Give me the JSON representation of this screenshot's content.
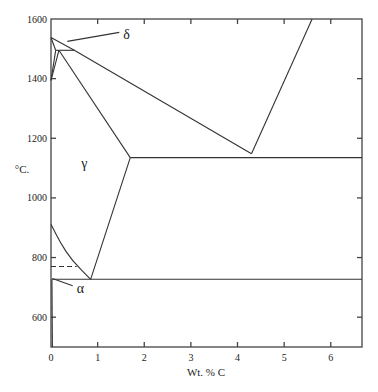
{
  "chart_data": {
    "type": "line",
    "title": "",
    "xlabel": "Wt. % C",
    "ylabel": "°C.",
    "xlim": [
      0,
      6.67
    ],
    "ylim": [
      500,
      1600
    ],
    "grid": false,
    "x_ticks": [
      0,
      1,
      2,
      3,
      4,
      5,
      6
    ],
    "x_tick_labels": [
      "0",
      "1",
      "2",
      "3",
      "4",
      "5",
      "6"
    ],
    "y_ticks": [
      600,
      800,
      1000,
      1200,
      1400,
      1600
    ],
    "y_tick_labels": [
      "600",
      "800",
      "1000",
      "1200",
      "1400",
      "1600"
    ],
    "series": [
      {
        "name": "liquidus-hypoeutectic",
        "style": "solid",
        "points": [
          [
            0,
            1538
          ],
          [
            0.5,
            1495
          ],
          [
            4.3,
            1148
          ]
        ]
      },
      {
        "name": "liquidus-hypereutectic",
        "style": "solid",
        "points": [
          [
            4.3,
            1148
          ],
          [
            5.6,
            1600
          ]
        ]
      },
      {
        "name": "delta-solidus",
        "style": "solid",
        "points": [
          [
            0,
            1538
          ],
          [
            0.1,
            1495
          ]
        ]
      },
      {
        "name": "peritectic-line",
        "style": "solid",
        "points": [
          [
            0.1,
            1495
          ],
          [
            0.5,
            1495
          ]
        ]
      },
      {
        "name": "delta-gamma-upper",
        "style": "solid",
        "points": [
          [
            0,
            1394
          ],
          [
            0.1,
            1495
          ]
        ]
      },
      {
        "name": "delta-gamma-lower",
        "style": "solid",
        "points": [
          [
            0,
            1394
          ],
          [
            0.17,
            1495
          ]
        ]
      },
      {
        "name": "austenite-solidus",
        "style": "solid",
        "points": [
          [
            0.17,
            1495
          ],
          [
            1.7,
            1135
          ]
        ]
      },
      {
        "name": "eutectic-line",
        "style": "solid",
        "points": [
          [
            1.7,
            1135
          ],
          [
            6.67,
            1135
          ]
        ]
      },
      {
        "name": "acm-line",
        "style": "solid",
        "points": [
          [
            1.7,
            1135
          ],
          [
            0.85,
            727
          ]
        ]
      },
      {
        "name": "a3-line",
        "style": "curve",
        "points": [
          [
            0,
            912
          ],
          [
            0.2,
            850
          ],
          [
            0.45,
            790
          ],
          [
            0.85,
            727
          ]
        ]
      },
      {
        "name": "eutectoid-line",
        "style": "solid",
        "points": [
          [
            0.02,
            727
          ],
          [
            6.67,
            727
          ]
        ]
      },
      {
        "name": "curie-line",
        "style": "dashed",
        "points": [
          [
            0,
            770
          ],
          [
            0.55,
            770
          ]
        ]
      },
      {
        "name": "alpha-solvus",
        "style": "solid",
        "points": [
          [
            0.02,
            727
          ],
          [
            0.03,
            500
          ]
        ]
      }
    ],
    "annotations": [
      {
        "text": "δ",
        "at": [
          1.55,
          1545
        ],
        "pointer_to": [
          0.35,
          1525
        ]
      },
      {
        "text": "γ",
        "at": [
          0.65,
          1115
        ]
      },
      {
        "text": "α",
        "at": [
          0.55,
          695
        ],
        "pointer_to": [
          0.03,
          730
        ]
      }
    ]
  }
}
